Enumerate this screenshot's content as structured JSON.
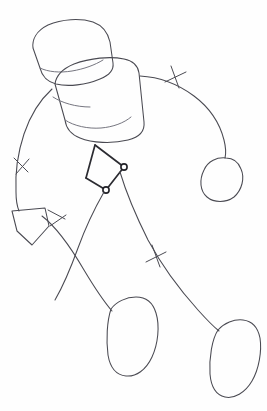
{
  "artwork": {
    "title": "Gesture Figure Sketch",
    "medium": "pencil line drawing",
    "subject": "simplified mannequin figure leaning forward",
    "background_color": "#fefefe",
    "ink_color": "#4a4a52",
    "ink_color_light": "#6e6e78",
    "ink_color_dark": "#2b2b31",
    "canvas": {
      "width": 267,
      "height": 411
    }
  },
  "parts": {
    "head": {
      "name": "head",
      "shape": "rounded rectangle / cylinder",
      "label": "Head"
    },
    "torso": {
      "name": "torso",
      "shape": "tilted box / ribcage",
      "label": "Torso"
    },
    "left_arm": {
      "name": "left-arm",
      "shape": "curved line",
      "label": "Left Arm"
    },
    "right_arm": {
      "name": "right-arm",
      "shape": "long arc",
      "label": "Right Arm"
    },
    "left_hand": {
      "name": "left-hand",
      "shape": "pentagon wedge",
      "label": "Left Hand"
    },
    "right_hand": {
      "name": "right-hand",
      "shape": "rounded blob",
      "label": "Right Hand"
    },
    "left_leg": {
      "name": "left-leg",
      "shape": "curved line",
      "label": "Left Leg"
    },
    "right_leg": {
      "name": "right-leg",
      "shape": "curved line",
      "label": "Right Leg"
    },
    "left_foot": {
      "name": "left-foot",
      "shape": "elongated blob",
      "label": "Left Foot"
    },
    "right_foot": {
      "name": "right-foot",
      "shape": "elongated blob",
      "label": "Right Foot"
    },
    "pelvis": {
      "name": "pelvis",
      "shape": "two joint dots joined by short bars",
      "label": "Pelvis"
    }
  },
  "markers": {
    "joint_dots": [
      {
        "label": "hip-joint-upper",
        "cx": 124,
        "cy": 167,
        "r": 3.1
      },
      {
        "label": "hip-joint-lower",
        "cx": 106,
        "cy": 190,
        "r": 3.1
      }
    ],
    "ticks": [
      {
        "label": "right-arm-elbow-tick"
      },
      {
        "label": "left-arm-elbow-tick"
      },
      {
        "label": "left-hand-wrist-tick"
      },
      {
        "label": "right-leg-knee-tick"
      }
    ]
  },
  "geometry": {
    "head_outline": "M 33 48 C 32 40 36 31 48 25 C 62 19 80 18 93 22 C 104 26 108 33 110 42 L 113 63 C 114 70 110 75 100 79 C 86 85 68 87 56 84 C 46 81 42 76 40 68 Z",
    "head_inner": "M 40 68 C 48 72 60 73 72 71 C 84 69 95 65 103 60",
    "torso_outline": "M 55 84 C 56 76 62 69 74 64 C 90 58 110 56 124 59 C 134 61 138 66 139 73 L 144 122 C 145 131 140 137 128 140 C 112 144 92 143 80 138 C 70 134 66 128 65 120 Z",
    "torso_inner_left": "M 65 120 C 74 126 88 129 101 128 C 113 127 124 123 131 117",
    "torso_shoulder_hint": "M 53 97 C 62 103 76 107 90 107",
    "left_arm": "M 52 89 C 40 100 30 116 24 134 C 18 152 15 172 16 192 C 16 199 17 206 19 211",
    "right_arm": "M 140 76 C 158 77 178 84 194 96 C 210 108 220 124 224 140 C 226 148 226 154 225 158",
    "left_hand": "M 12 211 L 45 208 L 49 226 L 32 245 L 17 231 Z",
    "right_hand": "M 226 158 C 217 157 208 161 204 170 C 199 180 200 191 207 197 C 214 203 226 203 234 197 C 242 190 245 178 241 169 C 238 161 232 158 226 158 Z",
    "pelvis_bar_a": "M 95 145 L 124 167",
    "pelvis_bar_b": "M 124 167 L 106 190",
    "pelvis_bar_c": "M 106 190 L 86 178",
    "pelvis_bar_d": "M 86 178 L 95 145",
    "left_leg": "M 104 192 C 96 206 86 226 78 248 C 70 270 62 288 55 300",
    "left_leg_outer": "M 42 216 C 55 226 70 246 84 270 C 96 290 106 304 112 311",
    "right_leg": "M 120 172 C 126 192 136 216 148 240 C 162 266 180 290 198 310 C 207 320 214 327 219 331",
    "left_foot": "M 111 309 C 116 302 126 297 136 297 C 146 297 153 303 156 313 C 160 326 158 344 152 357 C 146 370 136 377 126 376 C 116 375 110 367 108 355 C 106 340 107 321 111 309 Z",
    "right_foot": "M 218 330 C 224 323 234 319 243 320 C 252 321 258 328 260 338 C 262 351 259 369 252 381 C 245 393 234 399 225 397 C 216 395 211 386 210 374 C 209 358 212 339 218 330 Z",
    "tick_right_arm_a": "M 171 66 L 179 88",
    "tick_right_arm_b": "M 165 82 L 186 72",
    "tick_left_arm_a": "M 14 158 L 28 172",
    "tick_left_arm_b": "M 16 174 L 29 159",
    "tick_left_wrist_a": "M 48 210 L 65 219",
    "tick_left_wrist_b": "M 50 226 L 66 215",
    "tick_right_knee_a": "M 152 245 L 160 267",
    "tick_right_knee_b": "M 146 262 L 166 252"
  }
}
